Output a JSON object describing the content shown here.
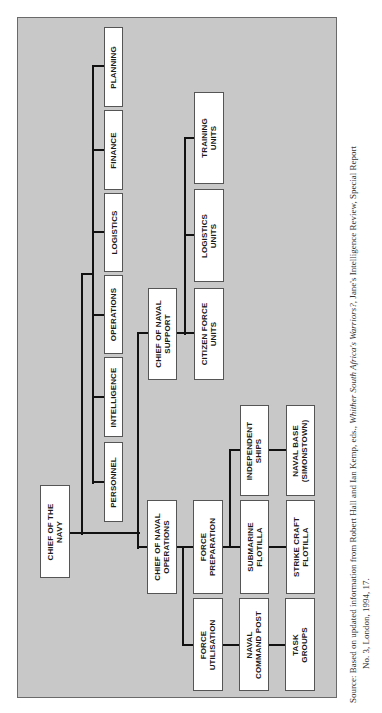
{
  "chart": {
    "boxes": {
      "chief_navy": "CHIEF OF THE\nNAVY",
      "planning": "PLANNING",
      "finance": "FINANCE",
      "logistics": "LOGISTICS",
      "operations": "OPERATIONS",
      "intelligence": "INTELLIGENCE",
      "personnel": "PERSONNEL",
      "chief_naval_support": "CHIEF OF NAVAL\nSUPPORT",
      "training_units": "TRAINING\nUNITS",
      "logistics_units": "LOGISTICS\nUNITS",
      "citizen_force_units": "CITIZEN FORCE\nUNITS",
      "chief_naval_operations": "CHIEF OF NAVAL\nOPERATIONS",
      "force_preparation": "FORCE\nPREPARATION",
      "force_utilisation": "FORCE\nUTILISATION",
      "independent_ships": "INDEPENDENT\nSHIPS",
      "naval_base": "NAVAL BASE\n(SIMONSTOWN)",
      "submarine_flotilla": "SUBMARINE\nFLOTILLA",
      "strike_craft_flotilla": "STRIKE CRAFT\nFLOTILLA",
      "naval_command_post": "NAVAL\nCOMMAND POST",
      "task_groups": "TASK\nGROUPS"
    },
    "hierarchy": {
      "CHIEF OF THE NAVY": {
        "staff": [
          "PERSONNEL",
          "INTELLIGENCE",
          "OPERATIONS",
          "LOGISTICS",
          "FINANCE",
          "PLANNING"
        ],
        "CHIEF OF NAVAL SUPPORT": [
          "CITIZEN FORCE UNITS",
          "LOGISTICS UNITS",
          "TRAINING UNITS"
        ],
        "CHIEF OF NAVAL OPERATIONS": {
          "FORCE UTILISATION": {
            "NAVAL COMMAND POST": [
              "TASK GROUPS"
            ]
          },
          "FORCE PREPARATION": {
            "SUBMARINE FLOTILLA": [
              "STRIKE CRAFT FLOTILLA"
            ],
            "INDEPENDENT SHIPS": [
              "NAVAL BASE (SIMONSTOWN)"
            ]
          }
        }
      }
    }
  },
  "source": {
    "prefix": "Source: Based on updated information from Robert Hall and Ian Kemp, eds., ",
    "title_italic": "Whither South Africa's Warriors?",
    "suffix": ", Jane's Intelligence Review, Special Report",
    "line2": "No. 3, London, 1994, 17."
  }
}
